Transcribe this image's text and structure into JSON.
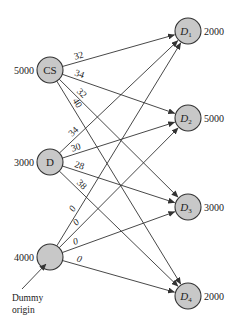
{
  "diagram": {
    "type": "transportation-network",
    "sources": [
      {
        "id": "CS",
        "label": "CS",
        "supply": "5000",
        "cx": 50,
        "cy": 70
      },
      {
        "id": "D",
        "label": "D",
        "supply": "3000",
        "cx": 50,
        "cy": 162
      },
      {
        "id": "DUMMY",
        "label": "",
        "supply": "4000",
        "cx": 50,
        "cy": 257
      }
    ],
    "destinations": [
      {
        "id": "D1",
        "label": "D",
        "sub": "1",
        "demand": "2000",
        "cx": 188,
        "cy": 31
      },
      {
        "id": "D2",
        "label": "D",
        "sub": "2",
        "demand": "5000",
        "cx": 188,
        "cy": 118
      },
      {
        "id": "D3",
        "label": "D",
        "sub": "3",
        "demand": "3000",
        "cx": 188,
        "cy": 207
      },
      {
        "id": "D4",
        "label": "D",
        "sub": "4",
        "demand": "2000",
        "cx": 188,
        "cy": 296
      }
    ],
    "edges": [
      {
        "from": "CS",
        "to": "D1",
        "cost": "32"
      },
      {
        "from": "CS",
        "to": "D2",
        "cost": "34"
      },
      {
        "from": "CS",
        "to": "D3",
        "cost": "32"
      },
      {
        "from": "CS",
        "to": "D4",
        "cost": "40"
      },
      {
        "from": "D",
        "to": "D1",
        "cost": "34"
      },
      {
        "from": "D",
        "to": "D2",
        "cost": "30"
      },
      {
        "from": "D",
        "to": "D3",
        "cost": "28"
      },
      {
        "from": "D",
        "to": "D4",
        "cost": "38"
      },
      {
        "from": "DUMMY",
        "to": "D1",
        "cost": "0"
      },
      {
        "from": "DUMMY",
        "to": "D2",
        "cost": "0"
      },
      {
        "from": "DUMMY",
        "to": "D3",
        "cost": "0"
      },
      {
        "from": "DUMMY",
        "to": "D4",
        "cost": "0"
      }
    ],
    "annotation": {
      "line1": "Dummy",
      "line2": "origin"
    }
  }
}
